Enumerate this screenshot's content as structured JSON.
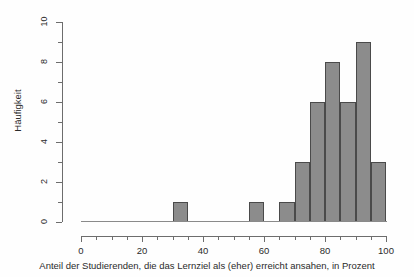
{
  "chart_data": {
    "type": "bar",
    "title": "",
    "subtitle": "",
    "xlabel": "Anteil der Studierenden, die das Lernziel als (eher) erreicht ansahen, in Prozent",
    "ylabel": "Häufigkeit",
    "xlim": [
      0,
      100
    ],
    "ylim": [
      0,
      10
    ],
    "grid": false,
    "legend": null,
    "bin_width": 5,
    "x_tick_labels": [
      "0",
      "20",
      "40",
      "60",
      "80",
      "100"
    ],
    "x_tick_values": [
      0,
      20,
      40,
      60,
      80,
      100
    ],
    "x_minor_tick_values": [
      5,
      10,
      15,
      25,
      30,
      35,
      45,
      50,
      55,
      65,
      70,
      75,
      85,
      90,
      95
    ],
    "y_tick_labels": [
      "0",
      "2",
      "4",
      "6",
      "8",
      "10"
    ],
    "y_tick_values": [
      0,
      2,
      4,
      6,
      8,
      10
    ],
    "y_minor_tick_values": [
      1,
      3,
      5,
      7,
      9
    ],
    "bar_fill_color": "#8c8c8c",
    "bar_border_color": "#4a4a4a",
    "axis_color": "#6d6d6d",
    "categories": [
      "30-35",
      "35-40",
      "40-45",
      "45-50",
      "50-55",
      "55-60",
      "60-65",
      "65-70",
      "70-75",
      "75-80",
      "80-85",
      "85-90",
      "90-95",
      "95-100"
    ],
    "bins": [
      {
        "x0": 30,
        "x1": 35,
        "count": 1
      },
      {
        "x0": 35,
        "x1": 40,
        "count": 0
      },
      {
        "x0": 40,
        "x1": 45,
        "count": 0
      },
      {
        "x0": 45,
        "x1": 50,
        "count": 0
      },
      {
        "x0": 50,
        "x1": 55,
        "count": 0
      },
      {
        "x0": 55,
        "x1": 60,
        "count": 1
      },
      {
        "x0": 60,
        "x1": 65,
        "count": 0
      },
      {
        "x0": 65,
        "x1": 70,
        "count": 1
      },
      {
        "x0": 70,
        "x1": 75,
        "count": 3
      },
      {
        "x0": 75,
        "x1": 80,
        "count": 6
      },
      {
        "x0": 80,
        "x1": 85,
        "count": 8
      },
      {
        "x0": 85,
        "x1": 90,
        "count": 6
      },
      {
        "x0": 90,
        "x1": 95,
        "count": 9
      },
      {
        "x0": 95,
        "x1": 100,
        "count": 3
      }
    ],
    "values": [
      1,
      0,
      0,
      0,
      0,
      1,
      0,
      1,
      3,
      6,
      8,
      6,
      9,
      3
    ]
  }
}
